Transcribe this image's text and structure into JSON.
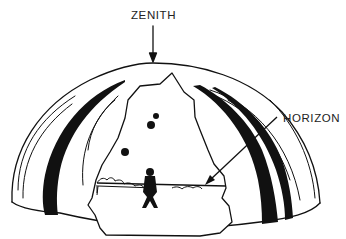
{
  "diagram": {
    "type": "celestial-dome-illustration",
    "labels": {
      "zenith": "ZENITH",
      "horizon": "HORIZON"
    },
    "elements": {
      "dome": "hemispherical sky dome with cutaway window",
      "observer": "human silhouette standing at center on horizon plane",
      "stars": 3,
      "bands": "black curved meridian bands on left and right sides of dome"
    },
    "colors": {
      "ink": "#111111",
      "background": "#ffffff",
      "label": "#222222"
    }
  }
}
